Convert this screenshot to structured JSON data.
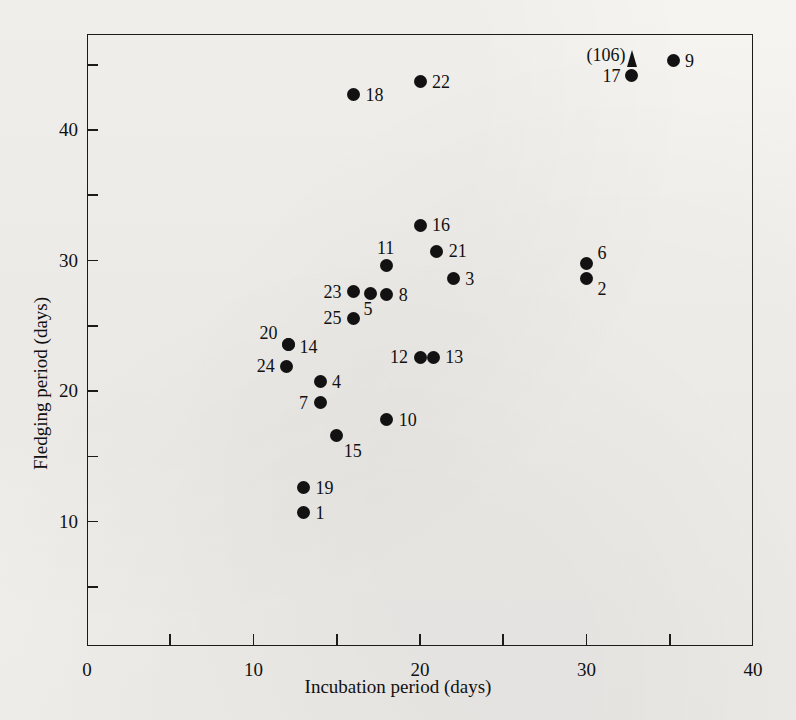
{
  "figure": {
    "background_color": "#f2f0ec",
    "ink_color": "#121212"
  },
  "chart_data": {
    "type": "scatter",
    "title": "",
    "xlabel": "Incubation period (days)",
    "ylabel": "Fledging period (days)",
    "xlim": [
      0,
      40
    ],
    "ylim": [
      0,
      47
    ],
    "xticks": [
      0,
      5,
      10,
      15,
      20,
      25,
      30,
      35,
      40
    ],
    "xtick_labels": [
      "0",
      "",
      "10",
      "",
      "20",
      "",
      "30",
      "",
      "40"
    ],
    "yticks": [
      5,
      10,
      15,
      20,
      25,
      30,
      35,
      40,
      45
    ],
    "ytick_labels": [
      "",
      "10",
      "",
      "20",
      "",
      "30",
      "",
      "40",
      ""
    ],
    "grid": false,
    "legend": "none",
    "marker": "filled-circle",
    "points": [
      {
        "label": "1",
        "x": 13.0,
        "y": 10.7,
        "label_pos": "right"
      },
      {
        "label": "2",
        "x": 30.0,
        "y": 28.6,
        "label_pos": "right-below"
      },
      {
        "label": "3",
        "x": 22.0,
        "y": 28.6,
        "label_pos": "right"
      },
      {
        "label": "4",
        "x": 14.0,
        "y": 20.7,
        "label_pos": "right"
      },
      {
        "label": "5",
        "x": 17.0,
        "y": 27.5,
        "label_pos": "right-below"
      },
      {
        "label": "6",
        "x": 30.0,
        "y": 29.8,
        "label_pos": "right-above"
      },
      {
        "label": "7",
        "x": 14.0,
        "y": 19.1,
        "label_pos": "left"
      },
      {
        "label": "8",
        "x": 18.0,
        "y": 27.4,
        "label_pos": "right"
      },
      {
        "label": "9",
        "x": 35.2,
        "y": 45.3,
        "label_pos": "right"
      },
      {
        "label": "10",
        "x": 18.0,
        "y": 17.8,
        "label_pos": "right"
      },
      {
        "label": "11",
        "x": 18.0,
        "y": 29.6,
        "label_pos": "above"
      },
      {
        "label": "12",
        "x": 20.0,
        "y": 22.6,
        "label_pos": "left"
      },
      {
        "label": "13",
        "x": 20.8,
        "y": 22.6,
        "label_pos": "right"
      },
      {
        "label": "14",
        "x": 12.1,
        "y": 23.6,
        "label_pos": "right"
      },
      {
        "label": "15",
        "x": 15.0,
        "y": 16.6,
        "label_pos": "right-below"
      },
      {
        "label": "16",
        "x": 20.0,
        "y": 32.7,
        "label_pos": "right"
      },
      {
        "label": "17",
        "x": 32.7,
        "y": 44.2,
        "label_pos": "left"
      },
      {
        "label": "18",
        "x": 16.0,
        "y": 42.7,
        "label_pos": "right"
      },
      {
        "label": "19",
        "x": 13.0,
        "y": 12.6,
        "label_pos": "right"
      },
      {
        "label": "20",
        "x": 12.1,
        "y": 23.6,
        "label_pos": "left-above"
      },
      {
        "label": "21",
        "x": 21.0,
        "y": 30.7,
        "label_pos": "right"
      },
      {
        "label": "22",
        "x": 20.0,
        "y": 43.7,
        "label_pos": "right"
      },
      {
        "label": "23",
        "x": 16.0,
        "y": 27.6,
        "label_pos": "left"
      },
      {
        "label": "24",
        "x": 12.0,
        "y": 21.9,
        "label_pos": "left"
      },
      {
        "label": "25",
        "x": 16.0,
        "y": 25.6,
        "label_pos": "left"
      }
    ],
    "annotations": [
      {
        "text": "(106)",
        "refers_to": "17",
        "note": "off-scale value indicator with arrow"
      }
    ]
  },
  "axes": {
    "x": {
      "title": "Incubation period (days)",
      "labels": [
        {
          "value": 0,
          "text": "0"
        },
        {
          "value": 10,
          "text": "10"
        },
        {
          "value": 20,
          "text": "20"
        },
        {
          "value": 30,
          "text": "30"
        },
        {
          "value": 40,
          "text": "40"
        }
      ]
    },
    "y": {
      "title": "Fledging period (days)",
      "labels": [
        {
          "value": 10,
          "text": "10"
        },
        {
          "value": 20,
          "text": "20"
        },
        {
          "value": 30,
          "text": "30"
        },
        {
          "value": 40,
          "text": "40"
        }
      ]
    }
  },
  "annotation": {
    "offscale_text": "(106)"
  }
}
